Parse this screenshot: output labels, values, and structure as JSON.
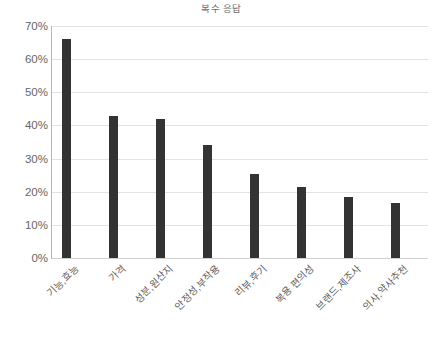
{
  "chart_data": {
    "type": "bar",
    "title": "복수 응답",
    "xlabel": "",
    "ylabel": "",
    "categories": [
      "기능,효능",
      "가격",
      "성분,원산지",
      "안정성,부작용",
      "리뷰,후기",
      "복용 편의성",
      "브랜드,제조사",
      "의사,약사추천"
    ],
    "values": [
      66.0,
      43.0,
      42.0,
      34.0,
      25.2,
      21.5,
      18.5,
      16.5
    ],
    "value_labels": [
      "66%",
      "43%",
      "42%",
      "34%",
      "25%",
      "22%",
      "19%",
      "17%"
    ],
    "ylim": [
      0,
      70
    ],
    "ytick_values": [
      0,
      10,
      20,
      30,
      40,
      50,
      60,
      70
    ],
    "ytick_labels": [
      "0%",
      "10%",
      "20%",
      "30%",
      "40%",
      "50%",
      "60%",
      "70%"
    ],
    "grid": true,
    "legend": false,
    "legend_position": "none",
    "bar_color": "#333333",
    "gridline_color": "#e3e3e3",
    "axis_color": "#b7b7b7",
    "text_color": "#5e5e5e",
    "background_color": "#ffffff"
  },
  "axes": {
    "y_ticks": [
      {
        "label": "70%",
        "value": 70
      },
      {
        "label": "60%",
        "value": 60
      },
      {
        "label": "50%",
        "value": 50
      },
      {
        "label": "40%",
        "value": 40
      },
      {
        "label": "30%",
        "value": 30
      },
      {
        "label": "20%",
        "value": 20
      },
      {
        "label": "10%",
        "value": 10
      },
      {
        "label": "0%",
        "value": 0
      }
    ]
  }
}
